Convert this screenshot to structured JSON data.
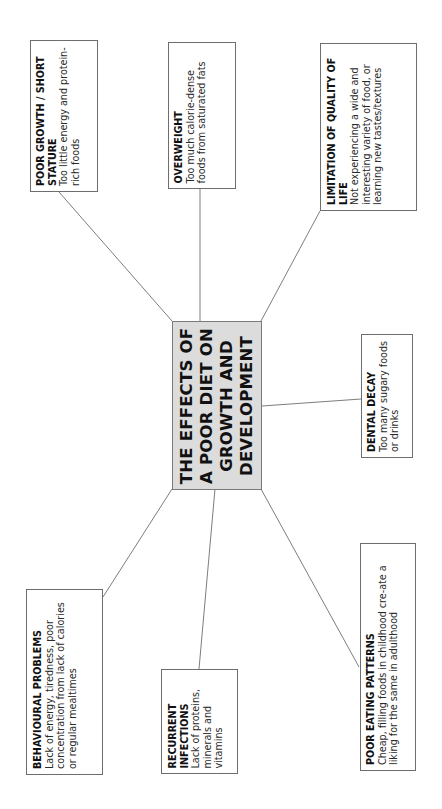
{
  "diagram": {
    "center": {
      "title": "THE EFFECTS OF A POOR DIET ON GROWTH AND DEVELOPMENT",
      "fill": "#dcdcdc"
    },
    "nodes": [
      {
        "id": "poor-growth",
        "title": "POOR GROWTH / SHORT STATURE",
        "text": "Too little energy and protein-rich foods"
      },
      {
        "id": "overweight",
        "title": "OVERWEIGHT",
        "text": "Too much calorie-dense foods from saturated fats"
      },
      {
        "id": "limitation",
        "title": "LIMITATION OF QUALITY OF LIFE",
        "text": "Not experiencing a wide and interesting variety of food, or learning new tastes/textures"
      },
      {
        "id": "dental-decay",
        "title": "DENTAL DECAY",
        "text": "Too many sugary foods or drinks"
      },
      {
        "id": "behavioural",
        "title": "BEHAVIOURAL PROBLEMS",
        "text": "Lack of energy, tiredness, poor concentration from lack of calories or regular mealtimes"
      },
      {
        "id": "recurrent",
        "title": "RECURRENT INFECTIONS",
        "text": "Lack of proteins, minerals and vitamins"
      },
      {
        "id": "poor-eating",
        "title": "POOR EATING PATTERNS",
        "text": "Cheap, filling foods in childhood cre-ate a liking for the same in adulthood"
      }
    ]
  }
}
